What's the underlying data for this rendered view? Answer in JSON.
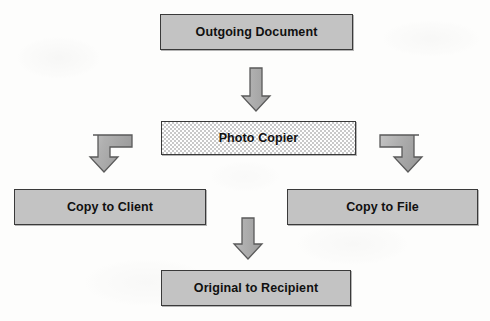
{
  "diagram": {
    "type": "flowchart",
    "background_color": "#fdfdfc",
    "node_fill_color": "#c3c3c3",
    "node_border_color": "#3a3a3a",
    "arrow_fill_color": "#a8a8a8",
    "arrow_border_color": "#555555",
    "copier_fill_pattern": "checkerboard-dither",
    "nodes": [
      {
        "id": "outgoing",
        "label": "Outgoing Document",
        "fill": "solid-gray"
      },
      {
        "id": "copier",
        "label": "Photo Copier",
        "fill": "checkered"
      },
      {
        "id": "copy_client",
        "label": "Copy to Client",
        "fill": "solid-gray"
      },
      {
        "id": "copy_file",
        "label": "Copy to File",
        "fill": "solid-gray"
      },
      {
        "id": "original",
        "label": "Original to Recipient",
        "fill": "solid-gray"
      }
    ],
    "arrows": [
      {
        "id": "to_copier",
        "from": "outgoing",
        "to": "copier",
        "shape": "straight-down",
        "icon": "arrow-down-icon"
      },
      {
        "id": "to_client",
        "from": "copier",
        "to": "copy_client",
        "shape": "elbow-left-down",
        "icon": "arrow-elbow-left-down-icon"
      },
      {
        "id": "to_file",
        "from": "copier",
        "to": "copy_file",
        "shape": "elbow-right-down",
        "icon": "arrow-elbow-right-down-icon"
      },
      {
        "id": "to_original",
        "from": "copier",
        "to": "original",
        "shape": "straight-down",
        "icon": "arrow-down-icon"
      }
    ]
  }
}
